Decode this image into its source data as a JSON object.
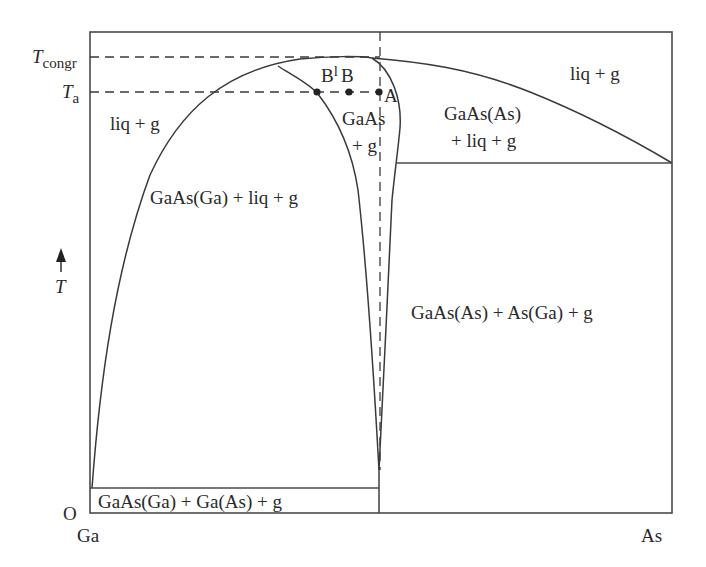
{
  "diagram": {
    "type": "phase diagram",
    "axes": {
      "origin_label": "O",
      "y_axis_label": "T",
      "y_axis_arrow": "arrow-up",
      "x_left_label": "Ga",
      "x_right_label": "As",
      "y_ticks": [
        {
          "main": "T",
          "sub": "congr"
        },
        {
          "main": "T",
          "sub": "a"
        }
      ]
    },
    "regions": {
      "liq_g_left": "liq + g",
      "liq_g_right": "liq + g",
      "gaas_ga_liq_g": "GaAs(Ga) + liq + g",
      "gaas_g_line1": "GaAs",
      "gaas_g_line2": "+ g",
      "gaas_as_liq_g_line1": "GaAs(As)",
      "gaas_as_liq_g_line2": "+ liq + g",
      "gaas_as_as_ga_g": "GaAs(As) + As(Ga) + g",
      "gaas_ga_ga_as_g": "GaAs(Ga) + Ga(As) + g"
    },
    "points": [
      {
        "label": "B",
        "sup": "l",
        "x": 317,
        "y": 92
      },
      {
        "label": "B",
        "sup": "",
        "x": 349,
        "y": 92
      },
      {
        "label": "A",
        "sup": "",
        "x": 379,
        "y": 92
      }
    ]
  }
}
